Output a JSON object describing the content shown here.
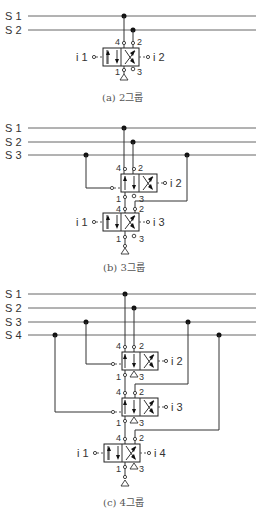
{
  "figures": [
    {
      "id": "a",
      "caption": "(a) 2그룹",
      "lines": [
        "S 1",
        "S 2"
      ],
      "valves": [
        {
          "ports": {
            "top_left": "4",
            "top_right": "2",
            "bottom_left": "1",
            "bottom_right": "3"
          },
          "left_input": "i 1",
          "right_input": "i 2"
        }
      ]
    },
    {
      "id": "b",
      "caption": "(b) 3그룹",
      "lines": [
        "S 1",
        "S 2",
        "S 3"
      ],
      "valves": [
        {
          "ports": {
            "top_left": "4",
            "top_right": "2",
            "bottom_left": "1",
            "bottom_right": "3"
          },
          "right_input": "i 2"
        },
        {
          "ports": {
            "top_left": "4",
            "top_right": "2",
            "bottom_left": "1",
            "bottom_right": "3"
          },
          "left_input": "i 1",
          "right_input": "i 3"
        }
      ]
    },
    {
      "id": "c",
      "caption": "(c) 4그룹",
      "lines": [
        "S 1",
        "S 2",
        "S 3",
        "S 4"
      ],
      "valves": [
        {
          "ports": {
            "top_left": "4",
            "top_right": "2",
            "bottom_left": "1",
            "bottom_right": "3"
          },
          "right_input": "i 2"
        },
        {
          "ports": {
            "top_left": "4",
            "top_right": "2",
            "bottom_left": "1",
            "bottom_right": "3"
          },
          "right_input": "i 3"
        },
        {
          "ports": {
            "top_left": "4",
            "top_right": "2",
            "bottom_left": "1",
            "bottom_right": "3"
          },
          "left_input": "i 1",
          "right_input": "i 4"
        }
      ]
    }
  ]
}
